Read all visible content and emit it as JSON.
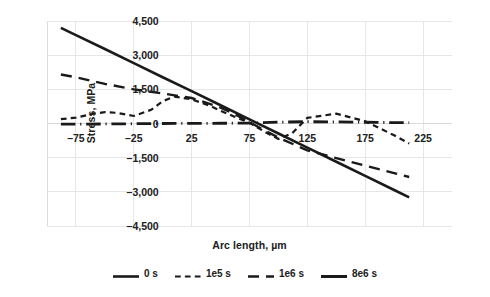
{
  "chart_data": {
    "type": "line",
    "title": "",
    "xlabel": "Arc length, µm",
    "ylabel": "Stress, MPa",
    "xlim": [
      -100,
      250
    ],
    "ylim": [
      -4500,
      4500
    ],
    "xticks": [
      -75,
      -25,
      25,
      75,
      125,
      175,
      225
    ],
    "xtick_labels": [
      "–75",
      "–25",
      "25",
      "75",
      "125",
      "175",
      "225"
    ],
    "yticks": [
      4500,
      3000,
      1500,
      0,
      -1500,
      -3000,
      -4500
    ],
    "ytick_labels": [
      "4,500",
      "3,000",
      "1,500",
      "0",
      "–1,500",
      "–3,000",
      "–4,500"
    ],
    "grid": true,
    "legend_position": "bottom",
    "series": [
      {
        "name": "0 s",
        "style": "solid",
        "width": 2.6,
        "color": "#1a1a1a",
        "x": [
          -88,
          -75,
          -50,
          -25,
          0,
          25,
          50,
          75,
          100,
          125,
          150,
          175,
          200,
          213
        ],
        "y": [
          4200,
          3880,
          3270,
          2650,
          2030,
          1420,
          800,
          180,
          -440,
          -1060,
          -1680,
          -2300,
          -2920,
          -3240
        ]
      },
      {
        "name": "1e5 s",
        "style": "short-dash",
        "width": 2.2,
        "color": "#1a1a1a",
        "x": [
          -88,
          -75,
          -60,
          -50,
          -40,
          -25,
          -10,
          0,
          10,
          25,
          40,
          50,
          62,
          75,
          88,
          100,
          112,
          125,
          150,
          175,
          200,
          213
        ],
        "y": [
          190,
          260,
          430,
          500,
          470,
          330,
          600,
          980,
          1180,
          1060,
          790,
          560,
          300,
          30,
          -360,
          -680,
          -420,
          250,
          430,
          100,
          -520,
          -880
        ]
      },
      {
        "name": "1e6 s",
        "style": "long-dash",
        "width": 2.4,
        "color": "#1a1a1a",
        "x": [
          -88,
          -75,
          -50,
          -25,
          0,
          25,
          50,
          62,
          75,
          88,
          100,
          125,
          150,
          175,
          200,
          213
        ],
        "y": [
          2150,
          2030,
          1740,
          1500,
          1320,
          1120,
          700,
          420,
          60,
          -300,
          -620,
          -1180,
          -1520,
          -1850,
          -2180,
          -2350
        ]
      },
      {
        "name": "8e6 s",
        "style": "dash-dot",
        "width": 2.8,
        "color": "#1a1a1a",
        "x": [
          -88,
          -75,
          -50,
          -25,
          0,
          25,
          50,
          75,
          100,
          125,
          150,
          175,
          200,
          213
        ],
        "y": [
          -30,
          -25,
          -20,
          -10,
          0,
          5,
          10,
          15,
          60,
          80,
          70,
          55,
          40,
          35
        ]
      }
    ]
  },
  "legend": {
    "items": [
      {
        "label": "0 s",
        "style": "solid"
      },
      {
        "label": "1e5 s",
        "style": "short-dash"
      },
      {
        "label": "1e6 s",
        "style": "long-dash"
      },
      {
        "label": "8e6 s",
        "style": "solid-thick"
      }
    ]
  },
  "colors": {
    "line": "#1a1a1a",
    "grid": "#e4e6e8",
    "axis": "#d9dcdf",
    "text": "#202020",
    "background": "#ffffff"
  }
}
